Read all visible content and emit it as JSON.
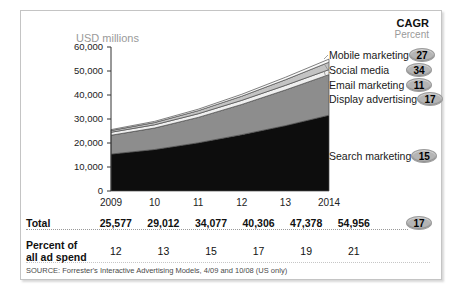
{
  "header": {
    "cagr_title": "CAGR",
    "cagr_subtitle": "Percent"
  },
  "chart": {
    "axis_title": "USD millions"
  },
  "chart_data": {
    "type": "area",
    "stacked": true,
    "title": "",
    "xlabel": "",
    "ylabel": "USD millions",
    "x": [
      2009,
      2010,
      2011,
      2012,
      2013,
      2014
    ],
    "x_tick_labels": [
      "2009",
      "10",
      "11",
      "12",
      "13",
      "2014"
    ],
    "ylim": [
      0,
      60000
    ],
    "y_ticks": [
      0,
      10000,
      20000,
      30000,
      40000,
      50000,
      60000
    ],
    "y_tick_labels": [
      "0",
      "10,000",
      "20,000",
      "30,000",
      "40,000",
      "50,000",
      "60,000"
    ],
    "grid": false,
    "legend_position": "right",
    "outline_color": "#4a4a4a",
    "series": [
      {
        "name": "Search marketing",
        "cagr_percent": 15,
        "color": "#0d0d0d",
        "values": [
          15393,
          17290,
          20090,
          23484,
          27246,
          31588
        ]
      },
      {
        "name": "Display advertising",
        "cagr_percent": 17,
        "color": "#8d8d8d",
        "values": [
          7829,
          8947,
          10577,
          12578,
          14848,
          16900
        ]
      },
      {
        "name": "Email marketing",
        "cagr_percent": 11,
        "color": "#efefef",
        "values": [
          1248,
          1353,
          1518,
          1712,
          1917,
          2081
        ]
      },
      {
        "name": "Social media",
        "cagr_percent": 34,
        "color": "#c3c3c3",
        "values": [
          716,
          937,
          1269,
          1728,
          2337,
          3113
        ]
      },
      {
        "name": "Mobile marketing",
        "cagr_percent": 27,
        "color": "#fafafa",
        "values": [
          391,
          485,
          623,
          804,
          1030,
          1274
        ]
      }
    ],
    "totals": [
      25577,
      29012,
      34077,
      40306,
      47378,
      54956
    ],
    "totals_cagr_percent": 17,
    "percent_of_all_ad_spend": [
      12,
      13,
      15,
      17,
      19,
      21
    ]
  },
  "legend": {
    "items": [
      {
        "label": "Mobile marketing",
        "cagr": "27"
      },
      {
        "label": "Social media",
        "cagr": "34"
      },
      {
        "label": "Email marketing",
        "cagr": "11"
      },
      {
        "label": "Display advertising",
        "cagr": "17"
      },
      {
        "label": "Search marketing",
        "cagr": "15"
      }
    ]
  },
  "table": {
    "total_label": "Total",
    "total_values": [
      "25,577",
      "29,012",
      "34,077",
      "40,306",
      "47,378",
      "54,956"
    ],
    "total_cagr": "17",
    "percent_label_line1": "Percent of",
    "percent_label_line2": "all ad spend",
    "percent_values": [
      "12",
      "13",
      "15",
      "17",
      "19",
      "21"
    ]
  },
  "source": "SOURCE: Forrester's Interactive Advertising Models, 4/09 and 10/08 (US only)"
}
